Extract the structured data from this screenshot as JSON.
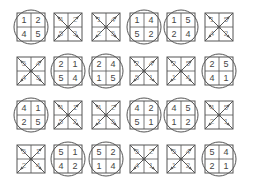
{
  "puzzle": {
    "rows": 4,
    "cols": 6,
    "cells": [
      {
        "type": "circled",
        "numbers": [
          "1",
          "2",
          "4",
          "5"
        ]
      },
      {
        "type": "crossed",
        "numbers": [
          "4",
          "2",
          "5",
          "3"
        ]
      },
      {
        "type": "crossed",
        "numbers": [
          "1",
          "4",
          "2",
          "5"
        ]
      },
      {
        "type": "circled",
        "numbers": [
          "1",
          "4",
          "5",
          "2"
        ]
      },
      {
        "type": "circled",
        "numbers": [
          "1",
          "5",
          "2",
          "4"
        ]
      },
      {
        "type": "crossed",
        "numbers": [
          "1",
          "5",
          "4",
          "2"
        ]
      },
      {
        "type": "crossed",
        "numbers": [
          "5",
          "4",
          "4",
          "5"
        ]
      },
      {
        "type": "circled",
        "numbers": [
          "2",
          "1",
          "5",
          "4"
        ]
      },
      {
        "type": "circled",
        "numbers": [
          "2",
          "4",
          "1",
          "5"
        ]
      },
      {
        "type": "crossed",
        "numbers": [
          "2",
          "4",
          "5",
          "1"
        ]
      },
      {
        "type": "crossed",
        "numbers": [
          "2",
          "5",
          "1",
          "4"
        ]
      },
      {
        "type": "circled",
        "numbers": [
          "2",
          "5",
          "4",
          "1"
        ]
      },
      {
        "type": "circled",
        "numbers": [
          "4",
          "1",
          "2",
          "5"
        ]
      },
      {
        "type": "crossed",
        "numbers": [
          "4",
          "1",
          "5",
          "2"
        ]
      },
      {
        "type": "crossed",
        "numbers": [
          "4",
          "2",
          "1",
          "5"
        ]
      },
      {
        "type": "circled",
        "numbers": [
          "4",
          "2",
          "5",
          "1"
        ]
      },
      {
        "type": "circled",
        "numbers": [
          "4",
          "5",
          "1",
          "2"
        ]
      },
      {
        "type": "crossed",
        "numbers": [
          "4",
          "5",
          "2",
          "1"
        ]
      },
      {
        "type": "crossed",
        "numbers": [
          "5",
          "1",
          "2",
          "4"
        ]
      },
      {
        "type": "circled",
        "numbers": [
          "5",
          "1",
          "4",
          "2"
        ]
      },
      {
        "type": "circled",
        "numbers": [
          "5",
          "2",
          "1",
          "4"
        ]
      },
      {
        "type": "crossed",
        "numbers": [
          "5",
          "2",
          "4",
          "1"
        ]
      },
      {
        "type": "crossed",
        "numbers": [
          "5",
          "4",
          "1",
          "2"
        ]
      },
      {
        "type": "circled",
        "numbers": [
          "5",
          "4",
          "2",
          "1"
        ]
      }
    ]
  },
  "colors": {
    "stroke": "#555555",
    "text": "#444444",
    "background": "#ffffff"
  }
}
